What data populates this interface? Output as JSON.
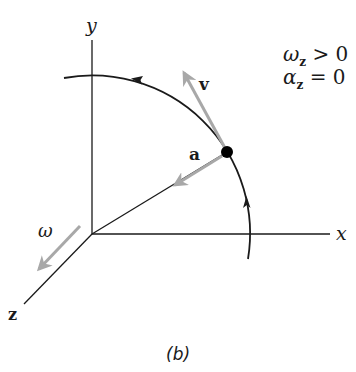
{
  "figure": {
    "caption": "(b)",
    "axes": {
      "x_label": "x",
      "y_label": "y",
      "z_label": "z"
    },
    "vectors": {
      "velocity_label": "v",
      "acceleration_label": "a",
      "angular_velocity_label": "ω"
    },
    "conditions": {
      "line1": {
        "symbol": "ω",
        "subscript": "z",
        "relation": " > 0"
      },
      "line2": {
        "symbol": "α",
        "subscript": "z",
        "relation": " = 0"
      }
    },
    "colors": {
      "line": "#1a1a1a",
      "vector_gray": "#a8a8a8",
      "particle": "#000000",
      "background": "#ffffff"
    }
  }
}
